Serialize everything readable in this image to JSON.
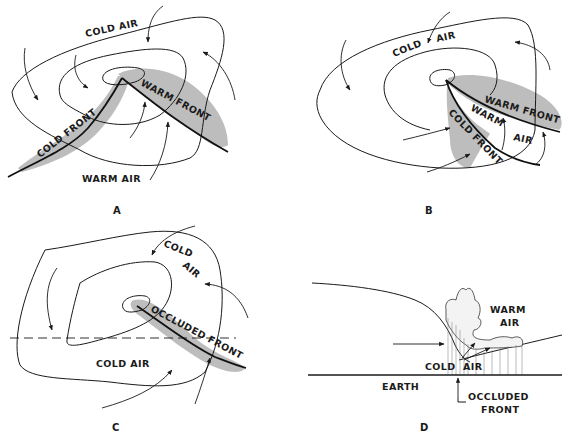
{
  "figure": {
    "panels": [
      {
        "id": "A",
        "label": "A",
        "labels": {
          "cold_air": "COLD AIR",
          "cold_front": "COLD FRONT",
          "warm_front": "WARM FRONT",
          "warm_air": "WARM AIR"
        }
      },
      {
        "id": "B",
        "label": "B",
        "labels": {
          "cold_air_1": "COLD",
          "cold_air_2": "AIR",
          "warm_front": "WARM FRONT",
          "warm_air_1": "WARM",
          "warm_air_2": "AIR",
          "cold_front": "COLD FRONT"
        }
      },
      {
        "id": "C",
        "label": "C",
        "labels": {
          "cold_air_top_1": "COLD",
          "cold_air_top_2": "AIR",
          "occluded_front": "OCCLUDED FRONT",
          "cold_air_bottom": "COLD AIR"
        }
      },
      {
        "id": "D",
        "label": "D",
        "labels": {
          "warm_air_1": "WARM",
          "warm_air_2": "AIR",
          "cold_air": "COLD  AIR",
          "earth": "EARTH",
          "occluded_front_1": "OCCLUDED",
          "occluded_front_2": "FRONT"
        }
      }
    ],
    "colors": {
      "line": "#1a1a1a",
      "shading": "#bdbdbd",
      "background": "#ffffff"
    }
  }
}
